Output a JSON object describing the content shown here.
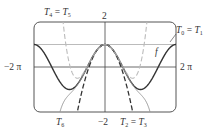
{
  "figure": {
    "labels": {
      "y_top": "2",
      "y_bottom": "−2",
      "x_left": "−2 π",
      "x_right": "2 π",
      "f": "f",
      "t0_t1": {
        "a": "T",
        "a_sub": "0",
        "eq": " = ",
        "b": "T",
        "b_sub": "1"
      },
      "t4_t5": {
        "a": "T",
        "a_sub": "4",
        "eq": " = ",
        "b": "T",
        "b_sub": "5"
      },
      "t2_t3": {
        "a": "T",
        "a_sub": "2",
        "eq": " = ",
        "b": "T",
        "b_sub": "3"
      },
      "t6": {
        "a": "T",
        "a_sub": "6"
      }
    },
    "colors": {
      "f": "#333333",
      "t0": "#bbbbbb",
      "t2": "#333333",
      "t4": "#bbbbbb",
      "t6": "#999999",
      "axes": "#444444",
      "frame": "#555555"
    }
  },
  "chart_data": {
    "type": "line",
    "title": "",
    "xlabel": "",
    "ylabel": "",
    "xlim": [
      -6.2832,
      6.2832
    ],
    "ylim": [
      -2,
      2
    ],
    "x_tick_labels": [
      "−2π",
      "2π"
    ],
    "y_tick_labels": [
      "2",
      "−2"
    ],
    "series": [
      {
        "name": "f",
        "expression": "cos(x)",
        "style": "solid dark"
      },
      {
        "name": "T0 = T1",
        "expression": "1",
        "style": "solid light gray"
      },
      {
        "name": "T2 = T3",
        "expression": "1 - x^2/2",
        "style": "dashed dark"
      },
      {
        "name": "T4 = T5",
        "expression": "1 - x^2/2 + x^4/24",
        "style": "dashed light gray"
      },
      {
        "name": "T6",
        "expression": "1 - x^2/2 + x^4/24 - x^6/720",
        "style": "solid gray"
      }
    ],
    "grid": false,
    "legend": "inline labels"
  }
}
